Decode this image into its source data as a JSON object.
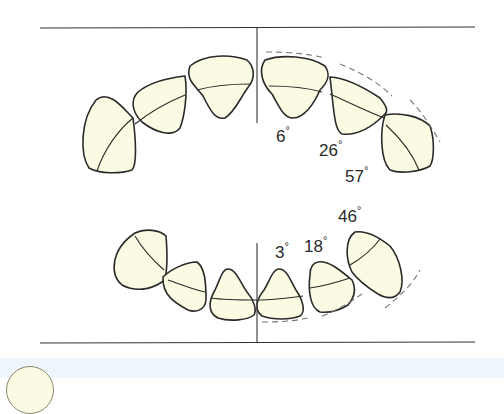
{
  "figure": {
    "type": "dental arch angulation diagram",
    "upper_arch": {
      "angles": [
        {
          "label": "6",
          "unit": "°",
          "tooth": "central incisor"
        },
        {
          "label": "26",
          "unit": "°",
          "tooth": "lateral incisor"
        },
        {
          "label": "57",
          "unit": "°",
          "tooth": "canine"
        }
      ]
    },
    "lower_arch": {
      "angles": [
        {
          "label": "3",
          "unit": "°",
          "tooth": "central incisor"
        },
        {
          "label": "18",
          "unit": "°",
          "tooth": "lateral incisor"
        },
        {
          "label": "46",
          "unit": "°",
          "tooth": "canine"
        }
      ]
    },
    "colors": {
      "tooth_fill": "#fbfbe3",
      "outline": "#2a2a2a",
      "dashed_line": "#777777",
      "bottom_strip": "#eef6fb"
    }
  }
}
